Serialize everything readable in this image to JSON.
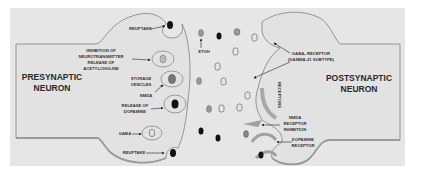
{
  "diagram": {
    "colors": {
      "background": "#e6e6e6",
      "outline": "#8a8a8a",
      "membrane_shade": "#a0a0a0",
      "dark_vesicle": "#111111",
      "gray_vesicle": "#888888"
    },
    "presynaptic": {
      "title_line1": "PRESYNAPTIC",
      "title_line2": "NEURON",
      "labels": {
        "reuptake_top": "REUPTAKE",
        "inhibition_l1": "INHIBITION OF",
        "inhibition_l2": "NEUROTRANSMITTER",
        "inhibition_l3": "RELEASE OF",
        "inhibition_l4": "ACETYLCHOLINE",
        "storage_l1": "STORAGE",
        "storage_l2": "VESICLES",
        "nmda": "NMDA",
        "dopamine_l1": "RELEASE OF",
        "dopamine_l2": "DOPAMINE",
        "gaba": "GABA",
        "reuptake_bottom": "REUPTAKE"
      }
    },
    "cleft": {
      "etoh": "ETOH"
    },
    "postsynaptic": {
      "title_line1": "POSTSYNAPTIC",
      "title_line2": "NEURON",
      "labels": {
        "gaba_receptor_l1": "GABAₐ RECEPTOR",
        "gaba_receptor_l2": "(GAMMA-21 SUBTYPE)",
        "receptors": "RECEPTORS",
        "nmda_l1": "NMDA",
        "nmda_l2": "RECEPTOR",
        "nmda_l3": "INHIBITION",
        "dopamine_l1": "DOPAMINE",
        "dopamine_l2": "RECEPTOR"
      }
    }
  }
}
